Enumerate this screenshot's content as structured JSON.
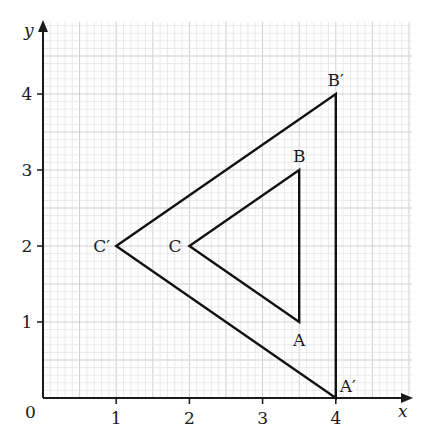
{
  "diagram": {
    "type": "coordinate-grid-enlargement",
    "axes": {
      "x_label": "x",
      "y_label": "y",
      "origin_label": "0",
      "x_ticks": [
        "1",
        "2",
        "3",
        "4"
      ],
      "y_ticks": [
        "1",
        "2",
        "3",
        "4"
      ]
    },
    "triangle_original": {
      "points": [
        {
          "label": "A",
          "x": 3.5,
          "y": 1
        },
        {
          "label": "B",
          "x": 3.5,
          "y": 3
        },
        {
          "label": "C",
          "x": 2,
          "y": 2
        }
      ]
    },
    "triangle_image": {
      "points": [
        {
          "label": "A′",
          "x": 4,
          "y": 0
        },
        {
          "label": "B′",
          "x": 4,
          "y": 4
        },
        {
          "label": "C′",
          "x": 1,
          "y": 2
        }
      ]
    },
    "colors": {
      "grid": "#d9d9d9",
      "axis": "#1a1a1a",
      "line": "#111111"
    }
  }
}
